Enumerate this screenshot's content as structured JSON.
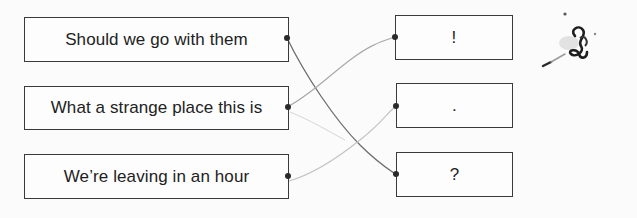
{
  "worksheet": {
    "type": "matching-exercise",
    "sentences": [
      {
        "text": "Should we go with them"
      },
      {
        "text": "What a strange place this is"
      },
      {
        "text": "We’re leaving in an hour"
      }
    ],
    "punctuation": [
      {
        "text": "!"
      },
      {
        "text": "."
      },
      {
        "text": "?"
      }
    ],
    "connections": [
      {
        "from": "Should we go with them",
        "to": "?"
      },
      {
        "from": "What a strange place this is",
        "to": "!"
      },
      {
        "from": "We’re leaving in an hour",
        "to": "."
      }
    ],
    "colors": {
      "box_border": "#3a3a3a",
      "line_dark": "#6e6e6e",
      "line_light": "#bdbdbd",
      "dot": "#2a2a2a"
    }
  }
}
